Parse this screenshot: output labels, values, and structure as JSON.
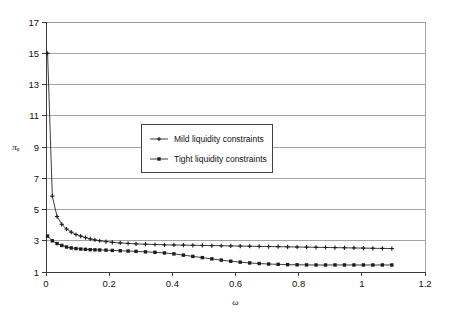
{
  "chart_data": {
    "type": "line",
    "title": "",
    "xlabel": "ω",
    "ylabel": "πᵩ",
    "xlim": [
      0,
      1.2
    ],
    "ylim": [
      1,
      17
    ],
    "grid": true,
    "legend_position": "center-upper-left",
    "xticks": [
      "0",
      "0.2",
      "0.4",
      "0.6",
      "0.8",
      "1",
      "1.2"
    ],
    "xtick_values": [
      0,
      0.2,
      0.4,
      0.6,
      0.8,
      1,
      1.2
    ],
    "yticks": [
      "1",
      "3",
      "5",
      "7",
      "9",
      "11",
      "13",
      "15",
      "17"
    ],
    "ytick_values": [
      1,
      3,
      5,
      7,
      9,
      11,
      13,
      15,
      17
    ],
    "series": [
      {
        "name": "Mild liquidity constraints",
        "marker": "plus",
        "color": "#1c1c1c",
        "x": [
          0.005,
          0.02,
          0.035,
          0.05,
          0.065,
          0.08,
          0.095,
          0.11,
          0.125,
          0.14,
          0.155,
          0.17,
          0.19,
          0.21,
          0.235,
          0.26,
          0.285,
          0.315,
          0.345,
          0.375,
          0.405,
          0.435,
          0.465,
          0.495,
          0.525,
          0.555,
          0.585,
          0.615,
          0.645,
          0.675,
          0.705,
          0.735,
          0.765,
          0.795,
          0.825,
          0.855,
          0.885,
          0.915,
          0.945,
          0.975,
          1.005,
          1.035,
          1.065,
          1.095
        ],
        "y": [
          15.0,
          5.85,
          4.55,
          4.05,
          3.75,
          3.55,
          3.4,
          3.3,
          3.2,
          3.12,
          3.05,
          3.0,
          2.95,
          2.9,
          2.86,
          2.83,
          2.8,
          2.78,
          2.76,
          2.74,
          2.73,
          2.72,
          2.71,
          2.7,
          2.69,
          2.68,
          2.67,
          2.66,
          2.65,
          2.64,
          2.63,
          2.62,
          2.61,
          2.6,
          2.59,
          2.58,
          2.57,
          2.56,
          2.55,
          2.54,
          2.53,
          2.52,
          2.51,
          2.5
        ]
      },
      {
        "name": "Tight liquidity constraints",
        "marker": "square",
        "color": "#1c1c1c",
        "x": [
          0.005,
          0.02,
          0.035,
          0.05,
          0.065,
          0.08,
          0.095,
          0.11,
          0.125,
          0.14,
          0.155,
          0.17,
          0.19,
          0.21,
          0.235,
          0.26,
          0.285,
          0.315,
          0.345,
          0.375,
          0.405,
          0.435,
          0.465,
          0.495,
          0.525,
          0.555,
          0.585,
          0.615,
          0.645,
          0.675,
          0.705,
          0.735,
          0.765,
          0.795,
          0.825,
          0.855,
          0.885,
          0.915,
          0.945,
          0.975,
          1.005,
          1.035,
          1.065,
          1.095
        ],
        "y": [
          3.3,
          3.0,
          2.82,
          2.7,
          2.6,
          2.54,
          2.5,
          2.47,
          2.45,
          2.43,
          2.42,
          2.41,
          2.4,
          2.38,
          2.36,
          2.34,
          2.32,
          2.29,
          2.26,
          2.22,
          2.16,
          2.08,
          2.0,
          1.92,
          1.84,
          1.76,
          1.69,
          1.63,
          1.58,
          1.54,
          1.51,
          1.49,
          1.47,
          1.46,
          1.455,
          1.45,
          1.45,
          1.45,
          1.45,
          1.45,
          1.45,
          1.45,
          1.45,
          1.45
        ]
      }
    ]
  },
  "legend": {
    "items": [
      {
        "label": "Mild liquidity constraints"
      },
      {
        "label": "Tight liquidity constraints"
      }
    ]
  }
}
